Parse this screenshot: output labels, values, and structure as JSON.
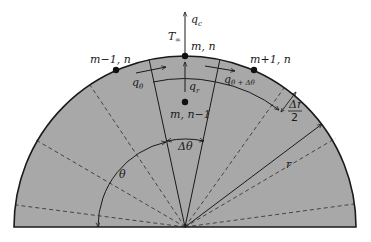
{
  "diagram": {
    "type": "semicircular finite-difference node network",
    "colors": {
      "fill": "#a8a8a8",
      "stroke": "#1a1a1a",
      "background": "#ffffff"
    },
    "nodes": [
      {
        "id": "m_n",
        "label": "m, n",
        "x": 185,
        "y": 56
      },
      {
        "id": "m_minus_1_n",
        "label": "m−1, n",
        "x": 116,
        "y": 70
      },
      {
        "id": "m_plus_1_n",
        "label": "m+1, n",
        "x": 254,
        "y": 70
      },
      {
        "id": "m_n_minus_1",
        "label": "m, n−1",
        "x": 185,
        "y": 102
      }
    ],
    "labels": {
      "q_c": "q",
      "q_c_sub": "c",
      "t_inf": "T",
      "t_inf_sub": "∞",
      "q_theta": "q",
      "q_theta_sub": "θ",
      "q_theta_dtheta": "q",
      "q_theta_dtheta_sub": "θ + Δθ",
      "q_r": "q",
      "q_r_sub": "r",
      "delta_theta": "Δθ",
      "theta": "θ",
      "r": "r",
      "delta_r_num": "Δr",
      "delta_r_den": "2"
    }
  }
}
